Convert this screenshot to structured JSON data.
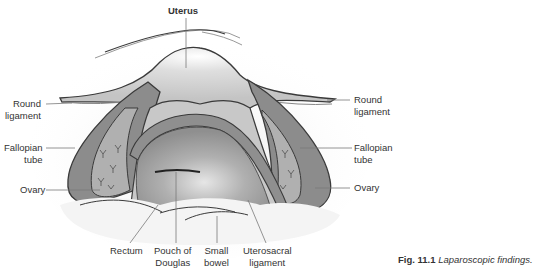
{
  "figure": {
    "title_label": "Uterus",
    "labels": {
      "round_ligament_left": [
        "Round",
        "ligament"
      ],
      "round_ligament_right": [
        "Round",
        "ligament"
      ],
      "fallopian_tube_left": [
        "Fallopian",
        "tube"
      ],
      "fallopian_tube_right": [
        "Fallopian",
        "tube"
      ],
      "ovary_left": "Ovary",
      "ovary_right": "Ovary",
      "rectum": "Rectum",
      "pouch_of_douglas": [
        "Pouch of",
        "Douglas"
      ],
      "small_bowel": [
        "Small",
        "bowel"
      ],
      "uterosacral_ligament": [
        "Uterosacral",
        "ligament"
      ]
    },
    "caption": {
      "number": "Fig. 11.1",
      "text": "Laparoscopic findings."
    },
    "colors": {
      "outline": "#3a3a3a",
      "tube_fill": "#8c8c8c",
      "ovary_fill": "#a9a9a9",
      "uterus_fill": "#d6d6d6",
      "pouch_fill": "#b5b5b5",
      "bowel_fill": "#f2f2f2",
      "leader": "#7a7a7a"
    }
  }
}
